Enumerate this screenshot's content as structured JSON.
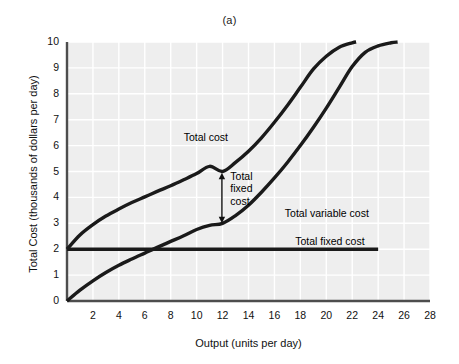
{
  "figure": {
    "panel_letter": "(a)",
    "background_color": "#eeeeee",
    "grid_color": "#ffffff",
    "curve_color": "#1a1a1a",
    "axis_color": "#4d4d4d"
  },
  "chart_data": {
    "type": "line",
    "title": "(a)",
    "xlabel": "Output (units per day)",
    "ylabel": "Total Cost (thousands of dollars per day)",
    "xlim": [
      0,
      28
    ],
    "ylim": [
      0,
      10
    ],
    "xticks": [
      2,
      4,
      6,
      8,
      10,
      12,
      14,
      16,
      18,
      20,
      22,
      24,
      26,
      28
    ],
    "yticks": [
      0,
      1,
      2,
      3,
      4,
      5,
      6,
      7,
      8,
      9,
      10
    ],
    "xtick_labels": [
      "2",
      "4",
      "6",
      "8",
      "10",
      "12",
      "14",
      "16",
      "18",
      "20",
      "22",
      "24",
      "26",
      "28"
    ],
    "ytick_labels": [
      "0",
      "1",
      "2",
      "3",
      "4",
      "5",
      "6",
      "7",
      "8",
      "9",
      "10"
    ],
    "grid": true,
    "legend": "inline-annotations",
    "series": [
      {
        "name": "Total cost",
        "label": "Total cost",
        "label_x": 9.0,
        "label_y": 6.3,
        "x": [
          0,
          1,
          2,
          3,
          4,
          5,
          6,
          7,
          8,
          9,
          10,
          11,
          12,
          13,
          14,
          15,
          16,
          17,
          18,
          19,
          20,
          21,
          22,
          22.3
        ],
        "y": [
          2.0,
          2.55,
          2.95,
          3.28,
          3.55,
          3.8,
          4.02,
          4.24,
          4.45,
          4.68,
          4.92,
          5.2,
          5.0,
          5.35,
          5.78,
          6.3,
          6.9,
          7.55,
          8.25,
          8.95,
          9.45,
          9.8,
          9.97,
          10.0
        ]
      },
      {
        "name": "Total variable cost",
        "label": "Total variable cost",
        "label_x": 16.8,
        "label_y": 3.35,
        "x": [
          0,
          1,
          2,
          3,
          4,
          5,
          6,
          7,
          8,
          9,
          10,
          11,
          12,
          13,
          14,
          15,
          16,
          17,
          18,
          19,
          20,
          21,
          22,
          23,
          24,
          25,
          25.5
        ],
        "y": [
          0.0,
          0.42,
          0.78,
          1.1,
          1.38,
          1.62,
          1.85,
          2.08,
          2.3,
          2.52,
          2.76,
          2.92,
          3.0,
          3.3,
          3.7,
          4.2,
          4.75,
          5.35,
          6.0,
          6.7,
          7.45,
          8.25,
          9.05,
          9.6,
          9.85,
          9.97,
          10.0
        ]
      },
      {
        "name": "Total fixed cost",
        "label": "Total fixed cost",
        "label_x": 17.6,
        "label_y": 2.28,
        "x": [
          0,
          24
        ],
        "y": [
          2.0,
          2.0
        ]
      }
    ],
    "annotations": [
      {
        "name": "total-fixed-cost-gap-arrow",
        "text": "Total fixed cost",
        "text_lines": [
          "Total",
          "fixed",
          "cost"
        ],
        "arrow_x": 11.95,
        "arrow_y_top": 4.95,
        "arrow_y_bottom": 3.0,
        "label_x": 12.6,
        "label_y": 4.8
      }
    ]
  }
}
